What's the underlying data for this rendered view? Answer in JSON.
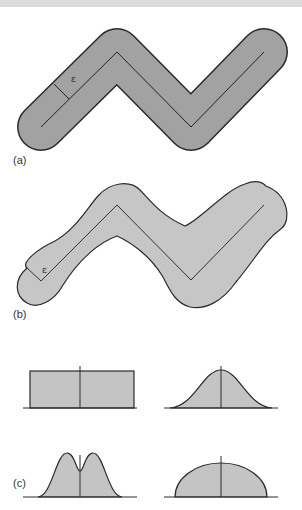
{
  "colors": {
    "band": "#dcdcdc",
    "fill_a": "#a2a2a2",
    "fill_b": "#c6c6c6",
    "fill_c": "#c4c4c4",
    "stroke": "#2a2a2a"
  },
  "panels": {
    "a": {
      "label": "(a)",
      "epsilon": "ε",
      "description": "Constant-width buffer around polyline"
    },
    "b": {
      "label": "(b)",
      "epsilon": "ε",
      "description": "Variable-width buffer around polyline"
    },
    "c": {
      "label": "(c)",
      "description": "Distribution profiles across line",
      "profiles": [
        "rectangular",
        "gaussian",
        "bimodal",
        "semi-elliptical"
      ]
    }
  }
}
